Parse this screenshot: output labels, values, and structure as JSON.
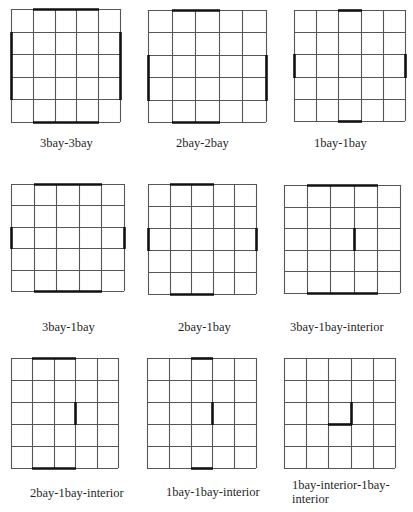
{
  "figure": {
    "grid_size": 5,
    "line_color": "#555555",
    "thick_color": "#111111",
    "panels": [
      {
        "id": "p1",
        "label": "3bay-3bay",
        "x": 11,
        "y": 9,
        "w": 109,
        "h": 113,
        "label_x": 40,
        "label_y": 136,
        "walls": [
          {
            "type": "h",
            "row": 0,
            "from": 1,
            "to": 4
          },
          {
            "type": "h",
            "row": 5,
            "from": 1,
            "to": 4
          },
          {
            "type": "v",
            "col": 0,
            "from": 1,
            "to": 4
          },
          {
            "type": "v",
            "col": 5,
            "from": 1,
            "to": 4
          }
        ]
      },
      {
        "id": "p2",
        "label": "2bay-2bay",
        "x": 148,
        "y": 10,
        "w": 118,
        "h": 112,
        "label_x": 176,
        "label_y": 136,
        "walls": [
          {
            "type": "h",
            "row": 0,
            "from": 1,
            "to": 3
          },
          {
            "type": "h",
            "row": 5,
            "from": 1,
            "to": 3
          },
          {
            "type": "v",
            "col": 0,
            "from": 2,
            "to": 4
          },
          {
            "type": "v",
            "col": 5,
            "from": 2,
            "to": 4
          }
        ]
      },
      {
        "id": "p3",
        "label": "1bay-1bay",
        "x": 294,
        "y": 10,
        "w": 111,
        "h": 111,
        "label_x": 314,
        "label_y": 136,
        "walls": [
          {
            "type": "h",
            "row": 0,
            "from": 2,
            "to": 3
          },
          {
            "type": "h",
            "row": 5,
            "from": 2,
            "to": 3
          },
          {
            "type": "v",
            "col": 0,
            "from": 2,
            "to": 3
          },
          {
            "type": "v",
            "col": 5,
            "from": 2,
            "to": 3
          }
        ]
      },
      {
        "id": "p4",
        "label": "3bay-1bay",
        "x": 11,
        "y": 184,
        "w": 113,
        "h": 107,
        "label_x": 42,
        "label_y": 320,
        "walls": [
          {
            "type": "h",
            "row": 0,
            "from": 1,
            "to": 4
          },
          {
            "type": "h",
            "row": 5,
            "from": 1,
            "to": 4
          },
          {
            "type": "v",
            "col": 0,
            "from": 2,
            "to": 3
          },
          {
            "type": "v",
            "col": 5,
            "from": 2,
            "to": 3
          }
        ]
      },
      {
        "id": "p5",
        "label": "2bay-1bay",
        "x": 148,
        "y": 184,
        "w": 108,
        "h": 110,
        "label_x": 178,
        "label_y": 320,
        "walls": [
          {
            "type": "h",
            "row": 0,
            "from": 1,
            "to": 3
          },
          {
            "type": "h",
            "row": 5,
            "from": 1,
            "to": 3
          },
          {
            "type": "v",
            "col": 0,
            "from": 2,
            "to": 3
          },
          {
            "type": "v",
            "col": 5,
            "from": 2,
            "to": 3
          }
        ]
      },
      {
        "id": "p6",
        "label": "3bay-1bay-interior",
        "x": 284,
        "y": 185,
        "w": 116,
        "h": 108,
        "label_x": 290,
        "label_y": 320,
        "walls": [
          {
            "type": "h",
            "row": 0,
            "from": 1,
            "to": 4
          },
          {
            "type": "h",
            "row": 5,
            "from": 1,
            "to": 4
          },
          {
            "type": "v",
            "col": 3,
            "from": 2,
            "to": 3
          }
        ]
      },
      {
        "id": "p7",
        "label": "2bay-1bay-interior",
        "x": 11,
        "y": 358,
        "w": 107,
        "h": 110,
        "label_x": 30,
        "label_y": 486,
        "walls": [
          {
            "type": "h",
            "row": 0,
            "from": 1,
            "to": 3
          },
          {
            "type": "h",
            "row": 5,
            "from": 1,
            "to": 3
          },
          {
            "type": "v",
            "col": 3,
            "from": 2,
            "to": 3
          }
        ]
      },
      {
        "id": "p8",
        "label": "1bay-1bay-interior",
        "x": 147,
        "y": 358,
        "w": 109,
        "h": 110,
        "label_x": 166,
        "label_y": 485,
        "walls": [
          {
            "type": "h",
            "row": 0,
            "from": 2,
            "to": 3
          },
          {
            "type": "h",
            "row": 5,
            "from": 2,
            "to": 3
          },
          {
            "type": "v",
            "col": 3,
            "from": 2,
            "to": 3
          }
        ]
      },
      {
        "id": "p9",
        "label": "1bay-interior-1bay-\ninterior",
        "x": 284,
        "y": 358,
        "w": 111,
        "h": 110,
        "label_x": 292,
        "label_y": 478,
        "walls": [
          {
            "type": "v",
            "col": 3,
            "from": 2,
            "to": 3
          },
          {
            "type": "h",
            "row": 3,
            "from": 2,
            "to": 3
          }
        ]
      }
    ]
  }
}
